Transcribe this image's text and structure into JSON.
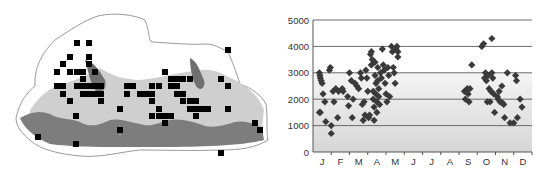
{
  "figure": {
    "left_panel": "Distribution map (grid squares of records over elevation-shaded relief)",
    "right_panel": "Elevation of records by month"
  },
  "map": {
    "colors": {
      "outline": "#9a9a9a",
      "low": "#ffffff",
      "mid": "#c9c9c9",
      "high": "#7a7a7a",
      "marker": "#000000"
    },
    "marker_size": 6,
    "markers": [
      [
        77,
        43
      ],
      [
        89,
        43
      ],
      [
        70,
        57
      ],
      [
        89,
        57
      ],
      [
        63,
        64
      ],
      [
        89,
        64
      ],
      [
        57,
        72
      ],
      [
        70,
        72
      ],
      [
        77,
        72
      ],
      [
        83,
        72
      ],
      [
        95,
        72
      ],
      [
        83,
        79
      ],
      [
        57,
        86
      ],
      [
        63,
        86
      ],
      [
        77,
        86
      ],
      [
        83,
        86
      ],
      [
        89,
        86
      ],
      [
        95,
        86
      ],
      [
        101,
        86
      ],
      [
        63,
        94
      ],
      [
        83,
        94
      ],
      [
        89,
        94
      ],
      [
        95,
        94
      ],
      [
        101,
        94
      ],
      [
        70,
        101
      ],
      [
        101,
        101
      ],
      [
        127,
        86
      ],
      [
        133,
        86
      ],
      [
        127,
        94
      ],
      [
        140,
        94
      ],
      [
        146,
        94
      ],
      [
        152,
        94
      ],
      [
        152,
        86
      ],
      [
        159,
        86
      ],
      [
        165,
        72
      ],
      [
        171,
        79
      ],
      [
        177,
        79
      ],
      [
        183,
        79
      ],
      [
        190,
        79
      ],
      [
        171,
        86
      ],
      [
        177,
        86
      ],
      [
        152,
        101
      ],
      [
        159,
        109
      ],
      [
        120,
        109
      ],
      [
        152,
        116
      ],
      [
        159,
        116
      ],
      [
        165,
        116
      ],
      [
        171,
        116
      ],
      [
        165,
        123
      ],
      [
        177,
        94
      ],
      [
        183,
        94
      ],
      [
        183,
        101
      ],
      [
        190,
        101
      ],
      [
        196,
        101
      ],
      [
        190,
        109
      ],
      [
        196,
        109
      ],
      [
        202,
        109
      ],
      [
        208,
        109
      ],
      [
        196,
        116
      ],
      [
        221,
        79
      ],
      [
        228,
        50
      ],
      [
        228,
        86
      ],
      [
        228,
        109
      ],
      [
        76,
        116
      ],
      [
        120,
        130
      ],
      [
        76,
        144
      ],
      [
        38,
        137
      ],
      [
        255,
        123
      ],
      [
        260,
        130
      ],
      [
        221,
        153
      ]
    ]
  },
  "chart_data": {
    "type": "scatter",
    "title": "",
    "xlabel": "",
    "ylabel": "",
    "categories": [
      "J",
      "F",
      "M",
      "A",
      "M",
      "J",
      "J",
      "A",
      "S",
      "O",
      "N",
      "D"
    ],
    "ylim": [
      0,
      5000
    ],
    "yticks": [
      0,
      1000,
      2000,
      3000,
      4000,
      5000
    ],
    "grid": {
      "horizontal": true,
      "vertical": false
    },
    "background_band": "gradient shading from 0 to 3000",
    "marker": "diamond",
    "marker_color": "#3a3a3a",
    "series": [
      {
        "name": "records",
        "points": [
          [
            0.05,
            3000
          ],
          [
            0.08,
            2900
          ],
          [
            0.1,
            2800
          ],
          [
            0.15,
            2700
          ],
          [
            0.2,
            2600
          ],
          [
            0.05,
            1500
          ],
          [
            0.1,
            1500
          ],
          [
            0.25,
            2200
          ],
          [
            0.35,
            1900
          ],
          [
            0.4,
            1150
          ],
          [
            0.6,
            3100
          ],
          [
            0.65,
            3200
          ],
          [
            0.7,
            1000
          ],
          [
            0.7,
            700
          ],
          [
            0.8,
            2300
          ],
          [
            0.85,
            1900
          ],
          [
            0.95,
            2400
          ],
          [
            1.1,
            2300
          ],
          [
            1.05,
            1300
          ],
          [
            1.3,
            2400
          ],
          [
            1.35,
            2300
          ],
          [
            1.6,
            2100
          ],
          [
            1.65,
            1750
          ],
          [
            1.7,
            3000
          ],
          [
            1.8,
            2700
          ],
          [
            1.85,
            1300
          ],
          [
            1.9,
            2000
          ],
          [
            2.0,
            2600
          ],
          [
            2.1,
            2500
          ],
          [
            2.2,
            2400
          ],
          [
            2.3,
            3000
          ],
          [
            2.35,
            2800
          ],
          [
            2.4,
            1800
          ],
          [
            2.45,
            1200
          ],
          [
            2.5,
            1900
          ],
          [
            2.55,
            1400
          ],
          [
            2.6,
            3100
          ],
          [
            2.65,
            2800
          ],
          [
            2.7,
            2300
          ],
          [
            2.75,
            1300
          ],
          [
            2.8,
            1400
          ],
          [
            2.85,
            3700
          ],
          [
            2.9,
            3800
          ],
          [
            2.9,
            3300
          ],
          [
            2.95,
            3500
          ],
          [
            3.0,
            2300
          ],
          [
            3.0,
            2000
          ],
          [
            3.05,
            1700
          ],
          [
            3.05,
            1200
          ],
          [
            3.1,
            3400
          ],
          [
            3.1,
            2900
          ],
          [
            3.15,
            2600
          ],
          [
            3.15,
            2200
          ],
          [
            3.2,
            1900
          ],
          [
            3.2,
            1500
          ],
          [
            3.25,
            3200
          ],
          [
            3.25,
            2700
          ],
          [
            3.3,
            2400
          ],
          [
            3.3,
            2100
          ],
          [
            3.35,
            1800
          ],
          [
            3.4,
            3000
          ],
          [
            3.45,
            2800
          ],
          [
            3.5,
            3900
          ],
          [
            3.55,
            3300
          ],
          [
            3.6,
            3100
          ],
          [
            3.65,
            2600
          ],
          [
            3.7,
            2200
          ],
          [
            3.75,
            1900
          ],
          [
            3.8,
            3200
          ],
          [
            3.85,
            2900
          ],
          [
            3.9,
            2100
          ],
          [
            4.0,
            4000
          ],
          [
            4.05,
            3800
          ],
          [
            4.1,
            3200
          ],
          [
            4.15,
            3000
          ],
          [
            4.2,
            2600
          ],
          [
            4.25,
            3900
          ],
          [
            4.3,
            4000
          ],
          [
            4.35,
            3800
          ],
          [
            4.35,
            3600
          ],
          [
            8.0,
            2300
          ],
          [
            8.05,
            2000
          ],
          [
            8.15,
            2400
          ],
          [
            8.2,
            2200
          ],
          [
            8.25,
            1900
          ],
          [
            8.3,
            2400
          ],
          [
            8.4,
            3300
          ],
          [
            8.95,
            4000
          ],
          [
            9.05,
            4100
          ],
          [
            9.1,
            2800
          ],
          [
            9.15,
            3000
          ],
          [
            9.2,
            2700
          ],
          [
            9.25,
            1900
          ],
          [
            9.3,
            2900
          ],
          [
            9.35,
            2400
          ],
          [
            9.4,
            1900
          ],
          [
            9.45,
            2300
          ],
          [
            9.5,
            4300
          ],
          [
            9.5,
            3000
          ],
          [
            9.55,
            2800
          ],
          [
            9.6,
            2200
          ],
          [
            9.65,
            1500
          ],
          [
            9.8,
            2100
          ],
          [
            9.85,
            2000
          ],
          [
            9.9,
            2300
          ],
          [
            9.95,
            1900
          ],
          [
            10.05,
            2500
          ],
          [
            10.1,
            1850
          ],
          [
            10.15,
            1800
          ],
          [
            10.2,
            1300
          ],
          [
            10.35,
            3000
          ],
          [
            10.5,
            1100
          ],
          [
            10.7,
            1100
          ],
          [
            10.8,
            2900
          ],
          [
            10.85,
            2700
          ],
          [
            10.9,
            1300
          ],
          [
            11.05,
            2000
          ],
          [
            11.15,
            1700
          ]
        ]
      }
    ],
    "y_tick_labels": [
      "0",
      "1000",
      "2000",
      "3000",
      "4000",
      "5000"
    ]
  }
}
